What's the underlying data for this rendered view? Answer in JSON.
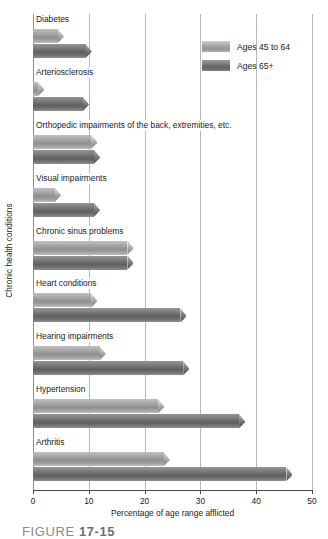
{
  "chart_data": {
    "type": "bar",
    "orientation": "horizontal",
    "title": "",
    "xlabel": "Percentage of age range afflicted",
    "ylabel": "Chronic health conditions",
    "xlim": [
      0,
      50
    ],
    "xticks": [
      0,
      10,
      20,
      30,
      40,
      50
    ],
    "xtick_labels": [
      "0",
      "10",
      "20",
      "30",
      "40",
      "50"
    ],
    "grid": true,
    "grid_axis": "x",
    "legend_position": "top-right",
    "categories": [
      "Diabetes",
      "Arteriosclerosis",
      "Orthopedic impairments of the back, extremities, etc.",
      "Visual impairments",
      "Chronic sinus problems",
      "Heart conditions",
      "Hearing impairments",
      "Hypertension",
      "Arthritis"
    ],
    "series": [
      {
        "name": "Ages 45 to 64",
        "color": "#9d9d9d",
        "values": [
          5.5,
          2.0,
          11.5,
          5.0,
          18.0,
          11.5,
          13.0,
          23.5,
          24.5
        ]
      },
      {
        "name": "Ages 65+",
        "color": "#6f6f6f",
        "values": [
          10.5,
          10.0,
          12.0,
          12.0,
          18.0,
          27.5,
          28.0,
          38.0,
          46.5
        ]
      }
    ]
  },
  "legend": {
    "entries": [
      {
        "label": "Ages 45 to 64",
        "swatch": "series-light"
      },
      {
        "label": "Ages 65+",
        "swatch": "series-dark"
      }
    ]
  },
  "caption": {
    "word": "FIGURE",
    "number": "17-15"
  }
}
